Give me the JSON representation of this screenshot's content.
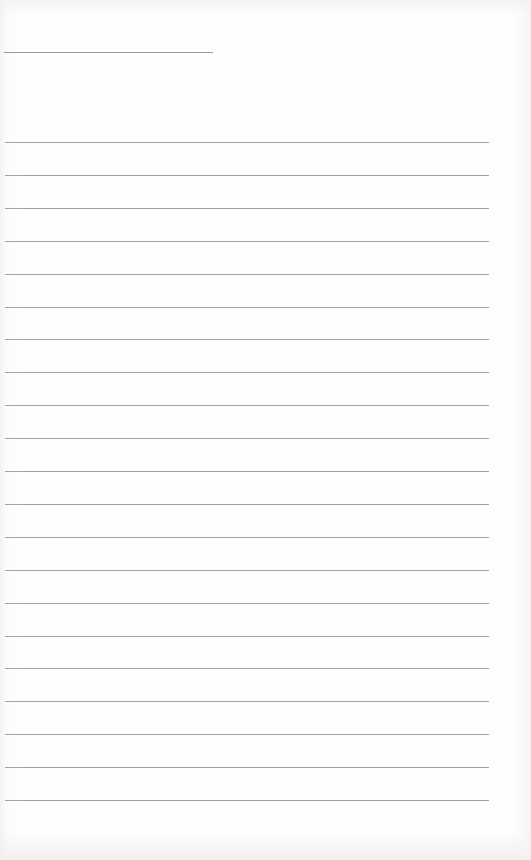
{
  "page": {
    "type": "blank lined paper",
    "header_line": {
      "label": ""
    },
    "ruled_lines_count": 21,
    "ruled_lines": [
      "",
      "",
      "",
      "",
      "",
      "",
      "",
      "",
      "",
      "",
      "",
      "",
      "",
      "",
      "",
      "",
      "",
      "",
      "",
      "",
      ""
    ]
  },
  "colors": {
    "paper": "#fdfdfd",
    "line": "#a3a3a3"
  }
}
